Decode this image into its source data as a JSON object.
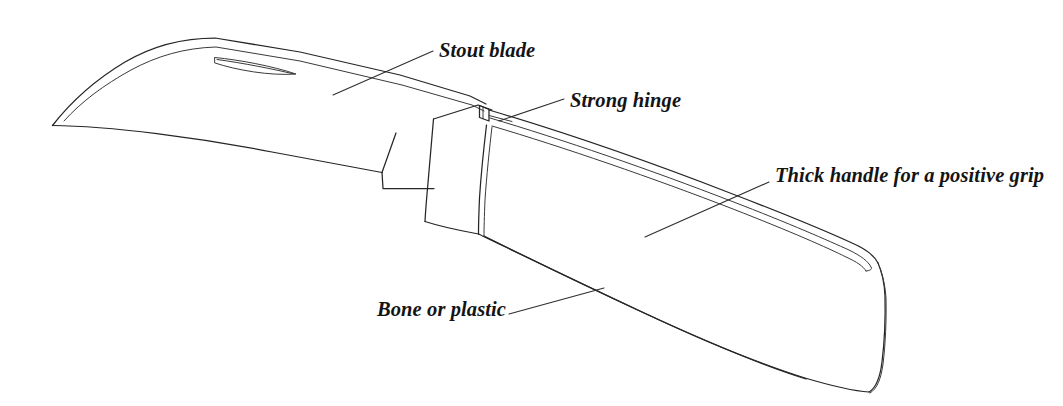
{
  "figure": {
    "kind": "line-drawing",
    "background_color": "#ffffff",
    "ink_color": "#262626",
    "label_color": "#141414",
    "callouts": [
      {
        "id": "stout-blade",
        "text": "Stout blade"
      },
      {
        "id": "strong-hinge",
        "text": "Strong hinge"
      },
      {
        "id": "thick-handle",
        "text": "Thick handle for a positive grip"
      },
      {
        "id": "bone-plastic",
        "text": "Bone or plastic"
      }
    ],
    "parts": [
      "blade",
      "nail-nick",
      "cutting-edge",
      "tang-step",
      "bolster",
      "hinge-pivot-tab",
      "handle",
      "handle-liner-groove",
      "handle-butt"
    ]
  }
}
